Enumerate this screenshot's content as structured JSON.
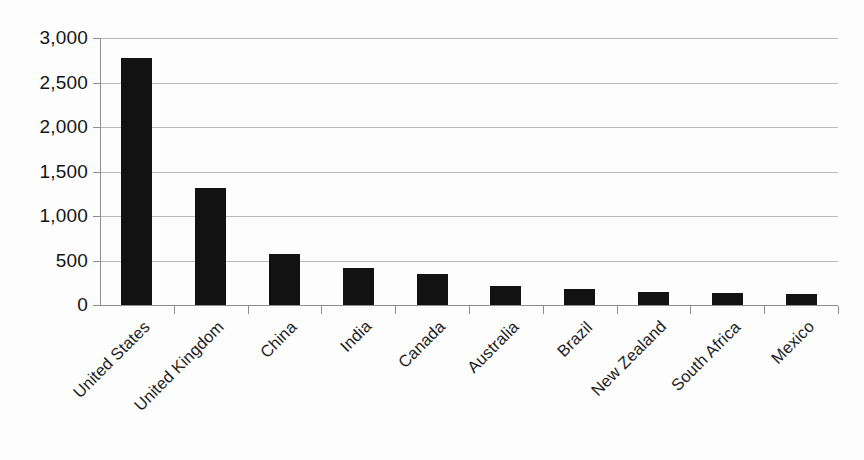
{
  "chart_data": {
    "type": "bar",
    "title": "",
    "subtitle": "",
    "xlabel": "",
    "ylabel": "",
    "categories": [
      "United States",
      "United Kingdom",
      "China",
      "India",
      "Canada",
      "Australia",
      "Brazil",
      "New Zealand",
      "South Africa",
      "Mexico"
    ],
    "values": [
      2780,
      1310,
      570,
      415,
      350,
      215,
      180,
      150,
      135,
      125
    ],
    "ylim": [
      0,
      3000
    ],
    "ytick_values": [
      0,
      500,
      1000,
      1500,
      2000,
      2500,
      3000
    ],
    "ytick_labels": [
      "0",
      "500",
      "1,000",
      "1,500",
      "2,000",
      "2,500",
      "3,000"
    ],
    "grid": true,
    "legend": false,
    "legend_position": "none",
    "bar_color": "#121212",
    "gridline_color": "#b9b9b9",
    "axis_color": "#8e8e8e",
    "background_color": "#fdfdfd",
    "xtick_label_rotation": 45
  }
}
